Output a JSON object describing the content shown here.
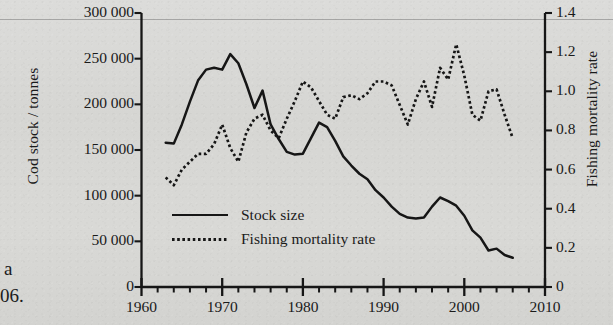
{
  "figure": {
    "page_fragments": [
      {
        "text": "a",
        "x": 4,
        "y": 258
      },
      {
        "text": "06.",
        "x": 0,
        "y": 285
      }
    ]
  },
  "chart_data": {
    "type": "line",
    "title": "",
    "xlabel": "",
    "ylabel": "Cod stock / tonnes",
    "y2label": "Fishing mortality rate",
    "xlim": [
      1960,
      2010
    ],
    "ylim": [
      0,
      300000
    ],
    "y2lim": [
      0,
      1.4
    ],
    "grid": false,
    "legend_position": "inside-lower-left",
    "x_ticks": [
      1960,
      1970,
      1980,
      1990,
      2000,
      2010
    ],
    "x_tick_labels": [
      "1960",
      "1970",
      "1980",
      "1990",
      "2000",
      "2010"
    ],
    "x_minor_tick_step": 2,
    "y_ticks": [
      0,
      50000,
      100000,
      150000,
      200000,
      250000,
      300000
    ],
    "y_tick_labels": [
      "0",
      "50 000",
      "100 000",
      "150 000",
      "200 000",
      "250 000",
      "300 000"
    ],
    "y2_ticks": [
      0,
      0.2,
      0.4,
      0.6,
      0.8,
      1.0,
      1.2,
      1.4
    ],
    "y2_tick_labels": [
      "0",
      "0.2",
      "0.4",
      "0.6",
      "0.8",
      "1.0",
      "1.2",
      "1.4"
    ],
    "series": [
      {
        "name": "Stock size",
        "axis": "left",
        "style": "solid",
        "color": "#161616",
        "x": [
          1963,
          1964,
          1965,
          1966,
          1967,
          1968,
          1969,
          1970,
          1971,
          1972,
          1973,
          1974,
          1975,
          1976,
          1977,
          1978,
          1979,
          1980,
          1981,
          1982,
          1983,
          1984,
          1985,
          1986,
          1987,
          1988,
          1989,
          1990,
          1991,
          1992,
          1993,
          1994,
          1995,
          1996,
          1997,
          1998,
          1999,
          2000,
          2001,
          2002,
          2003,
          2004,
          2005,
          2006
        ],
        "y": [
          158000,
          157000,
          178000,
          203000,
          226000,
          238000,
          240000,
          238000,
          255000,
          245000,
          222000,
          196000,
          215000,
          178000,
          162000,
          148000,
          145000,
          146000,
          163000,
          180000,
          175000,
          160000,
          143000,
          133000,
          124000,
          118000,
          106000,
          98000,
          88000,
          80000,
          76000,
          75000,
          76000,
          88000,
          98000,
          94000,
          89000,
          78000,
          62000,
          54000,
          40000,
          42000,
          35000,
          32000
        ]
      },
      {
        "name": "Fishing mortality rate",
        "axis": "right",
        "style": "dotted",
        "color": "#161616",
        "x": [
          1963,
          1964,
          1965,
          1966,
          1967,
          1968,
          1969,
          1970,
          1971,
          1972,
          1973,
          1974,
          1975,
          1976,
          1977,
          1978,
          1979,
          1980,
          1981,
          1982,
          1983,
          1984,
          1985,
          1986,
          1987,
          1988,
          1989,
          1990,
          1991,
          1992,
          1993,
          1994,
          1995,
          1996,
          1997,
          1998,
          1999,
          2000,
          2001,
          2002,
          2003,
          2004,
          2005,
          2006
        ],
        "y": [
          0.56,
          0.52,
          0.6,
          0.64,
          0.68,
          0.68,
          0.73,
          0.83,
          0.71,
          0.64,
          0.79,
          0.86,
          0.88,
          0.8,
          0.76,
          0.86,
          0.95,
          1.05,
          1.02,
          0.95,
          0.88,
          0.86,
          0.97,
          0.98,
          0.96,
          0.99,
          1.05,
          1.05,
          1.03,
          0.93,
          0.83,
          0.96,
          1.05,
          0.92,
          1.12,
          1.06,
          1.24,
          1.08,
          0.88,
          0.85,
          1.0,
          1.01,
          0.88,
          0.76
        ]
      }
    ],
    "legend": [
      {
        "label": "Stock size",
        "style": "solid"
      },
      {
        "label": "Fishing mortality rate",
        "style": "dotted"
      }
    ]
  }
}
